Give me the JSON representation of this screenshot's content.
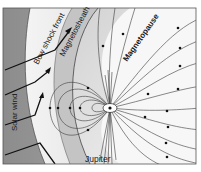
{
  "labels": {
    "bow_shock": "Bow shock front",
    "magnetosheath": "Magnetosheath",
    "magnetopause": "Magnetopause",
    "solar_wind": "Solar wind",
    "planet": "Jupiter"
  },
  "colors": {
    "background": "#ffffff",
    "solar_wind_region": "#9a9a9a",
    "bow_shock_band": "#d8d8d8",
    "magnetosheath_region": "#bdbdbd",
    "magnetosphere": "#ececec",
    "field_line": "#3a3a3a",
    "arrow": "#111111"
  }
}
